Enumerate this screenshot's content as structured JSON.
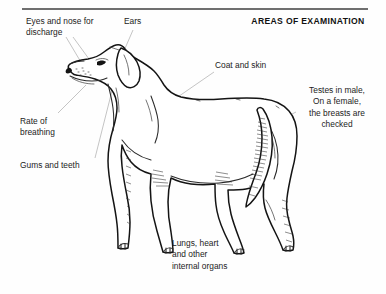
{
  "page": {
    "title": "AREAS OF EXAMINATION",
    "rule_color": "#6f6f6f",
    "background_color": "#fefefe",
    "ink_color": "#141414",
    "leader_line_color": "#b9b9b9"
  },
  "subject": {
    "name": "dog-profile-illustration",
    "orientation": "facing-left",
    "style": "black-and-white-line-drawing"
  },
  "labels": {
    "eyes_nose": "Eyes and nose for\ndischarge",
    "ears": "Ears",
    "coat_skin": "Coat and skin",
    "testes": "Testes in male,\nOn a female,\nthe breasts are\nchecked",
    "rate_of_breathing": "Rate of\nbreathing",
    "gums_teeth": "Gums and teeth",
    "lungs_heart": "Lungs, heart\nand other\ninternal organs"
  }
}
